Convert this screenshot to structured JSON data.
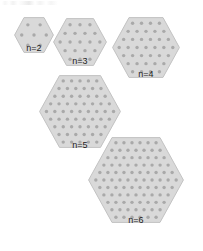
{
  "figure": {
    "background_color": "#ffffff",
    "width": 203,
    "height": 251
  },
  "style": {
    "hex_fill": "#d9d9d9",
    "hex_stroke": "#c2c2c2",
    "dot_color": "#a9a9a9",
    "label_color": "#1c1c1c"
  },
  "hexagons": [
    {
      "id": "hex-n2",
      "label": "n=2",
      "n": 2,
      "dot_count": 7,
      "row_dot_counts": [
        2,
        3,
        2
      ],
      "x": 14,
      "y": 17,
      "width": 40,
      "height": 36,
      "label_y": 43
    },
    {
      "id": "hex-n3",
      "label": "n=3",
      "n": 3,
      "dot_count": 19,
      "row_dot_counts": [
        3,
        4,
        5,
        4,
        3
      ],
      "x": 53,
      "y": 18,
      "width": 54,
      "height": 48,
      "label_y": 56
    },
    {
      "id": "hex-n4",
      "label": "n=4",
      "n": 4,
      "dot_count": 37,
      "row_dot_counts": [
        4,
        5,
        6,
        7,
        6,
        5,
        4
      ],
      "x": 112,
      "y": 17,
      "width": 68,
      "height": 61,
      "label_y": 69
    },
    {
      "id": "hex-n5",
      "label": "n=5",
      "n": 5,
      "dot_count": 61,
      "row_dot_counts": [
        5,
        6,
        7,
        8,
        9,
        8,
        7,
        6,
        5
      ],
      "x": 39,
      "y": 75,
      "width": 82,
      "height": 73,
      "label_y": 140
    },
    {
      "id": "hex-n6",
      "label": "n=6",
      "n": 6,
      "dot_count": 91,
      "row_dot_counts": [
        6,
        7,
        8,
        9,
        10,
        11,
        10,
        9,
        8,
        7,
        6
      ],
      "x": 88,
      "y": 137,
      "width": 96,
      "height": 86,
      "label_y": 215
    }
  ],
  "top_artifact": {
    "present": true,
    "description": "faint light-gray smudge marks along top-left edge"
  }
}
